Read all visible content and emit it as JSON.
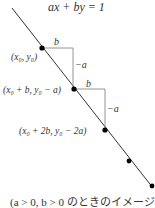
{
  "diagram": {
    "equation": "ax + by = 1",
    "step_labels": {
      "horizontal": "b",
      "vertical": "−a"
    },
    "points": [
      {
        "label": "(x₀, y₀)",
        "x": 42,
        "y": 48
      },
      {
        "label": "(x₀ + b, y₀ − a)",
        "x": 74,
        "y": 89
      },
      {
        "label": "(x₀ + 2b, y₀ − 2a)",
        "x": 105,
        "y": 130
      },
      {
        "label": "",
        "x": 129,
        "y": 161
      },
      {
        "label": "",
        "x": 152,
        "y": 186
      }
    ],
    "caption": "(a > 0, b > 0 のときのイメージ)",
    "colors": {
      "line": "#333333",
      "guide": "#888888",
      "point": "#000000",
      "text": "#333333"
    }
  }
}
